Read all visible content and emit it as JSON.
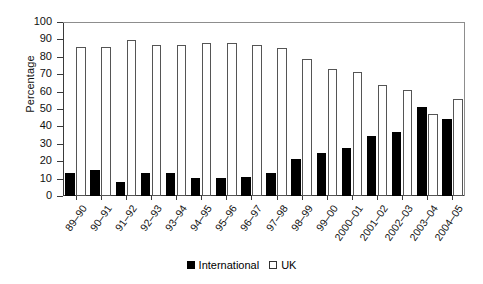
{
  "chart_data": {
    "type": "bar",
    "title": "",
    "xlabel": "",
    "ylabel": "Percentage",
    "ylim": [
      0,
      100
    ],
    "ytick_step": 10,
    "yticks": [
      0,
      10,
      20,
      30,
      40,
      50,
      60,
      70,
      80,
      90,
      100
    ],
    "grid": false,
    "legend_position": "bottom-center",
    "categories": [
      "89–90",
      "90–91",
      "91–92",
      "92–93",
      "93–94",
      "94–95",
      "95–96",
      "96–97",
      "97–98",
      "98–99",
      "99–00",
      "2000–01",
      "2001–02",
      "2002–03",
      "2003–04",
      "2004–05"
    ],
    "series": [
      {
        "name": "International",
        "color": "#000000",
        "values": [
          13,
          15,
          8,
          13,
          13,
          10.5,
          10.5,
          11,
          13,
          21,
          25,
          27.5,
          34.5,
          37,
          51,
          44
        ]
      },
      {
        "name": "UK",
        "color": "#ffffff",
        "values": [
          85.5,
          85.5,
          89.5,
          87,
          87,
          88,
          88,
          87,
          85,
          78.5,
          73,
          71,
          64,
          61,
          47,
          56
        ]
      }
    ]
  },
  "legend": {
    "items": [
      {
        "label": "International",
        "swatch": "filled-black-square"
      },
      {
        "label": "UK",
        "swatch": "open-white-square"
      }
    ]
  },
  "axes": {
    "y_title": "Percentage"
  }
}
